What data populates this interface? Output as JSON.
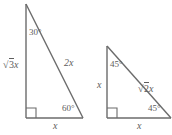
{
  "figure": {
    "background_color": "#ffffff",
    "stroke_color": "#6b6b6b",
    "text_color": "#5d5d5d",
    "triangles": [
      {
        "name": "30-60-90-triangle",
        "angles": [
          {
            "label": "30°",
            "vertex": "top"
          },
          {
            "label": "60°",
            "vertex": "bottom-right"
          },
          {
            "label": "right-angle-marker",
            "vertex": "bottom-left"
          }
        ],
        "sides": {
          "vertical_leg_prefix": "√",
          "vertical_leg_radicand": "3",
          "vertical_leg_suffix": "x",
          "hypotenuse": "2x",
          "base": "x"
        }
      },
      {
        "name": "45-45-90-triangle",
        "angles": [
          {
            "label": "45°",
            "vertex": "top"
          },
          {
            "label": "45°",
            "vertex": "bottom-right"
          },
          {
            "label": "right-angle-marker",
            "vertex": "bottom-left"
          }
        ],
        "sides": {
          "vertical_leg": "x",
          "hypotenuse_prefix": "√",
          "hypotenuse_radicand": "2",
          "hypotenuse_suffix": "x",
          "base": "x"
        }
      }
    ]
  }
}
